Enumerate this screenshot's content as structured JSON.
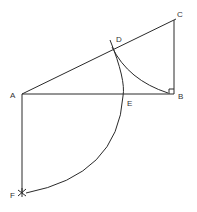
{
  "diagram": {
    "type": "geometric-construction",
    "colors": {
      "stroke": "#2a2a2a",
      "label": "#333333",
      "background": "#ffffff"
    },
    "points": {
      "A": {
        "label": "A",
        "x": 22,
        "y": 94
      },
      "B": {
        "label": "B",
        "x": 174,
        "y": 94
      },
      "C": {
        "label": "C",
        "x": 174,
        "y": 20
      },
      "D": {
        "label": "D",
        "x": 112,
        "y": 48
      },
      "E": {
        "label": "E",
        "x": 123,
        "y": 94
      },
      "F": {
        "label": "F",
        "x": 22,
        "y": 192
      }
    },
    "segments": [
      "AB",
      "AC",
      "BC",
      "AF"
    ],
    "arcs": [
      "D-to-B (centered at C)",
      "D-E-F (centered at A)"
    ],
    "annotations": {
      "right_angle_at": "B"
    }
  }
}
